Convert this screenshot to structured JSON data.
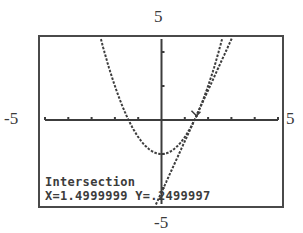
{
  "window": {
    "ymax_label": "5",
    "xmin_label": "-5",
    "xmax_label": "5",
    "ymin_label": "-5",
    "xmin": -5,
    "xmax": 5,
    "ymin": -5,
    "ymax": 5,
    "xscl": 1,
    "yscl": 2
  },
  "graph": {
    "functions": [
      {
        "name": "Y1",
        "expr": "x^2-2",
        "style": "dotted"
      },
      {
        "name": "Y2",
        "expr": "3x-4.25",
        "style": "dotted"
      }
    ],
    "colors": {
      "ink": "#3c3c3c",
      "frame": "#4a4a4a",
      "background": "#ffffff"
    }
  },
  "readout": {
    "title": "Intersection",
    "x_text": "X=1.4999999",
    "y_text": "Y=.2499997",
    "x_value": 1.4999999,
    "y_value": 0.2499997
  },
  "cursor": {
    "x": 1.5,
    "y": 0.25
  }
}
